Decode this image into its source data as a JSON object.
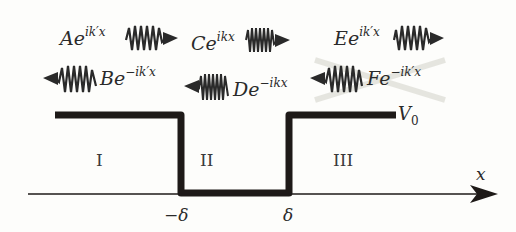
{
  "diagram": {
    "type": "finite potential well with incident, reflected and transmitted plane waves",
    "colors": {
      "line": "#1e1a18",
      "text": "#2a2a2a",
      "background": "#fdfdfb",
      "crossout": "#d8d8d0"
    },
    "waves": [
      {
        "id": "A",
        "coef": "A",
        "base": "e",
        "exponent": "ik′x",
        "direction": "right",
        "region": "I"
      },
      {
        "id": "B",
        "coef": "B",
        "base": "e",
        "exponent": "−ik′x",
        "direction": "left",
        "region": "I"
      },
      {
        "id": "C",
        "coef": "C",
        "base": "e",
        "exponent": "ikx",
        "direction": "right",
        "region": "II"
      },
      {
        "id": "D",
        "coef": "D",
        "base": "e",
        "exponent": "−ikx",
        "direction": "left",
        "region": "II"
      },
      {
        "id": "E",
        "coef": "E",
        "base": "e",
        "exponent": "ik′x",
        "direction": "right",
        "region": "III"
      },
      {
        "id": "F",
        "coef": "F",
        "base": "e",
        "exponent": "−ik′x",
        "direction": "left",
        "region": "III",
        "crossed_out": true
      }
    ],
    "regions": [
      "I",
      "II",
      "III"
    ],
    "potential_label": "V",
    "potential_sub": "0",
    "axis_label": "x",
    "ticks": [
      "−δ",
      "δ"
    ]
  }
}
